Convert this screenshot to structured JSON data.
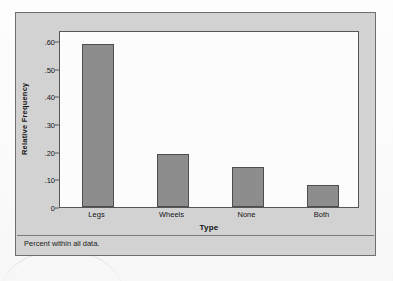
{
  "figure": {
    "footnote": "Percent within all data.",
    "frame_color": "#d2d2d2",
    "panel_color": "#fcfcfc",
    "bar_color": "#8d8d8d",
    "bar_border_color": "#4e4e50",
    "axis_color": "#55565a"
  },
  "bleed": {
    "top_right": "Exercises for Ch",
    "mid": "relative frequency",
    "low": "distribution table"
  },
  "chart_data": {
    "type": "bar",
    "title": "",
    "subtitle": "",
    "xlabel": "Type",
    "ylabel": "Relative Frequency",
    "categories": [
      "Legs",
      "Wheels",
      "None",
      "Both"
    ],
    "values": [
      0.59,
      0.19,
      0.145,
      0.08
    ],
    "ylim": [
      0,
      0.64
    ],
    "ytick_values": [
      0,
      0.1,
      0.2,
      0.3,
      0.4,
      0.5,
      0.6
    ],
    "ytick_labels": [
      "0",
      ".10",
      ".20",
      ".30",
      ".40",
      ".50",
      ".60"
    ],
    "grid": false,
    "legend": false,
    "legend_position": "none",
    "annotations": [
      "Percent within all data."
    ]
  }
}
